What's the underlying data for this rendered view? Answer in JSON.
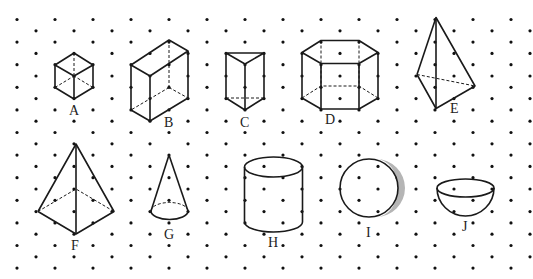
{
  "diagram": {
    "grid": {
      "origin_x": 17,
      "origin_y": 19.5,
      "dx": 19,
      "dy": 11.3,
      "cols": 28,
      "rows": 23,
      "dot_color": "#111111"
    },
    "line_color": "#1a1a1a",
    "shade_color": "#b5b5b5",
    "figures": [
      {
        "id": "A",
        "label": "A",
        "name": "cube"
      },
      {
        "id": "B",
        "label": "B",
        "name": "rectangular prism"
      },
      {
        "id": "C",
        "label": "C",
        "name": "triangular prism"
      },
      {
        "id": "D",
        "label": "D",
        "name": "hexagonal prism"
      },
      {
        "id": "E",
        "label": "E",
        "name": "triangular pyramid"
      },
      {
        "id": "F",
        "label": "F",
        "name": "square pyramid"
      },
      {
        "id": "G",
        "label": "G",
        "name": "cone"
      },
      {
        "id": "H",
        "label": "H",
        "name": "cylinder"
      },
      {
        "id": "I",
        "label": "I",
        "name": "sphere"
      },
      {
        "id": "J",
        "label": "J",
        "name": "hemisphere"
      }
    ]
  }
}
